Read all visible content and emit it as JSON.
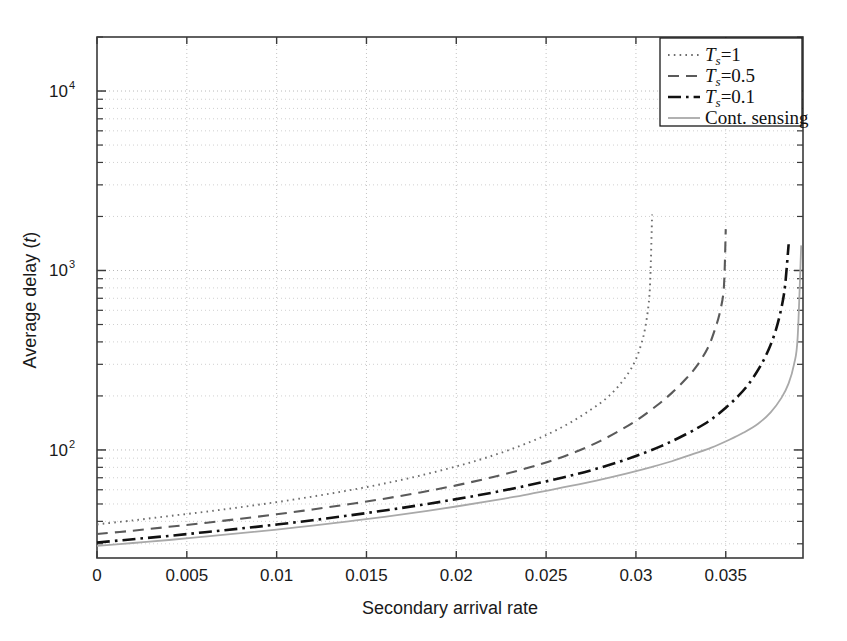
{
  "figure": {
    "background": "#ffffff",
    "axis_color": "#3a3a3a",
    "grid_color": "#b9b9b9"
  },
  "chart_data": {
    "type": "line",
    "title": "",
    "xlabel": "Secondary arrival rate",
    "ylabel": "Average delay (t)",
    "ylabel_symbol": "t",
    "xscale": "linear",
    "yscale": "log",
    "xlim": [
      0,
      0.0393
    ],
    "ylim": [
      25,
      20000
    ],
    "grid": true,
    "grid_which": "both",
    "legend_position": "top-right",
    "xticks": [
      0,
      0.005,
      0.01,
      0.015,
      0.02,
      0.025,
      0.03,
      0.035
    ],
    "xticklabels": [
      "0",
      "0.005",
      "0.01",
      "0.015",
      "0.02",
      "0.025",
      "0.03",
      "0.035"
    ],
    "yticks": [
      100,
      1000,
      10000
    ],
    "yticklabels": [
      "10^2",
      "10^3",
      "10^4"
    ],
    "ytick_mantissa": [
      "10",
      "10",
      "10"
    ],
    "ytick_exponent": [
      "2",
      "3",
      "4"
    ],
    "series": [
      {
        "name": "Ts=1",
        "legend_label": "T_s=1",
        "legend_prefix": "T",
        "legend_sub": "s",
        "legend_suffix": "=1",
        "style": "dotted",
        "color": "#6e6e6e",
        "width": 1.9,
        "x": [
          0.0,
          0.002,
          0.004,
          0.006,
          0.008,
          0.01,
          0.012,
          0.014,
          0.016,
          0.018,
          0.02,
          0.0215,
          0.023,
          0.0245,
          0.0255,
          0.0265,
          0.0275,
          0.0283,
          0.029,
          0.0296,
          0.03,
          0.0303,
          0.0305,
          0.0307,
          0.0308,
          0.0309
        ],
        "y": [
          38.5,
          40.5,
          42.8,
          45.2,
          48.0,
          51.2,
          55.0,
          59.5,
          65.0,
          72.0,
          81.0,
          89.5,
          100.5,
          115.0,
          128.0,
          145.0,
          168.0,
          192.0,
          225.0,
          270.0,
          320.0,
          390.0,
          470.0,
          640.0,
          900.0,
          2050.0
        ]
      },
      {
        "name": "Ts=0.5",
        "legend_label": "T_s=0.5",
        "legend_prefix": "T",
        "legend_sub": "s",
        "legend_suffix": "=0.5",
        "style": "dashed",
        "color": "#5a5a5a",
        "width": 2.1,
        "x": [
          0.0,
          0.002,
          0.004,
          0.006,
          0.008,
          0.01,
          0.012,
          0.014,
          0.016,
          0.018,
          0.02,
          0.022,
          0.024,
          0.0255,
          0.0268,
          0.028,
          0.0292,
          0.0302,
          0.0312,
          0.032,
          0.0328,
          0.0334,
          0.034,
          0.0344,
          0.0347,
          0.0349,
          0.035
        ],
        "y": [
          34.0,
          35.5,
          37.3,
          39.2,
          41.4,
          43.8,
          46.6,
          49.8,
          53.5,
          58.0,
          63.5,
          70.5,
          79.5,
          88.5,
          99.0,
          112.0,
          130.0,
          150.0,
          178.0,
          208.0,
          250.0,
          295.0,
          370.0,
          470.0,
          600.0,
          820.0,
          1700.0
        ]
      },
      {
        "name": "Ts=0.1",
        "legend_label": "T_s=0.1",
        "legend_prefix": "T",
        "legend_sub": "s",
        "legend_suffix": "=0.1",
        "style": "dashdot",
        "color": "#111111",
        "width": 2.6,
        "x": [
          0.0,
          0.002,
          0.004,
          0.006,
          0.008,
          0.01,
          0.012,
          0.014,
          0.016,
          0.018,
          0.02,
          0.022,
          0.024,
          0.026,
          0.0275,
          0.029,
          0.0302,
          0.0314,
          0.0324,
          0.0334,
          0.0342,
          0.035,
          0.0357,
          0.0363,
          0.0369,
          0.0374,
          0.0378,
          0.0381,
          0.0383,
          0.0385
        ],
        "y": [
          30.5,
          31.8,
          33.2,
          34.8,
          36.5,
          38.4,
          40.6,
          43.1,
          46.0,
          49.3,
          53.2,
          57.8,
          63.5,
          70.5,
          77.0,
          85.5,
          94.0,
          105.0,
          117.0,
          132.0,
          148.0,
          172.0,
          200.0,
          235.0,
          290.0,
          365.0,
          470.0,
          620.0,
          820.0,
          1400.0
        ]
      },
      {
        "name": "Cont. sensing",
        "legend_label": "Cont. sensing",
        "style": "solid",
        "color": "#a9a9a9",
        "width": 1.8,
        "x": [
          0.0,
          0.002,
          0.004,
          0.006,
          0.008,
          0.01,
          0.012,
          0.014,
          0.016,
          0.018,
          0.02,
          0.022,
          0.024,
          0.026,
          0.0278,
          0.0294,
          0.0308,
          0.032,
          0.0332,
          0.0342,
          0.0352,
          0.036,
          0.0368,
          0.0375,
          0.0381,
          0.0385,
          0.0388,
          0.039,
          0.0392
        ],
        "y": [
          29.2,
          30.3,
          31.5,
          32.9,
          34.4,
          36.0,
          37.9,
          40.0,
          42.4,
          45.2,
          48.4,
          52.2,
          56.6,
          62.0,
          67.5,
          73.5,
          80.0,
          86.5,
          95.0,
          103.0,
          114.0,
          125.0,
          140.0,
          162.0,
          195.0,
          235.0,
          300.0,
          420.0,
          1380.0
        ]
      }
    ]
  },
  "legend": {
    "entries": [
      {
        "label": "T_s=1",
        "style": "dotted"
      },
      {
        "label": "T_s=0.5",
        "style": "dashed"
      },
      {
        "label": "T_s=0.1",
        "style": "dashdot"
      },
      {
        "label": "Cont. sensing",
        "style": "solid"
      }
    ]
  }
}
